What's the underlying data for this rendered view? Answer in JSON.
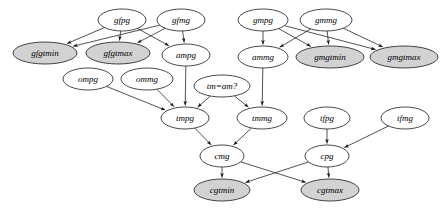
{
  "diagram": {
    "type": "directed-acyclic-graph",
    "colors": {
      "node_fill": "#ffffff",
      "node_fill_shaded": "#d2d2d2",
      "node_stroke": "#1a1a1a",
      "edge_stroke": "#1a1a1a",
      "label_color": "#000000",
      "background": "#ffffff"
    },
    "nodes": [
      {
        "id": "gfpg",
        "label": "gfpg",
        "cx": 122,
        "cy": 20,
        "rx": 24,
        "ry": 11,
        "shaded": false
      },
      {
        "id": "gfmg",
        "label": "gfmg",
        "cx": 181,
        "cy": 20,
        "rx": 24,
        "ry": 11,
        "shaded": false
      },
      {
        "id": "gfgtmin",
        "label": "gfgtmin",
        "cx": 45,
        "cy": 53,
        "rx": 32,
        "ry": 11,
        "shaded": true
      },
      {
        "id": "gfgtmax",
        "label": "gfgtmax",
        "cx": 118,
        "cy": 53,
        "rx": 32,
        "ry": 11,
        "shaded": true
      },
      {
        "id": "ampg",
        "label": "ampg",
        "cx": 186,
        "cy": 55,
        "rx": 24,
        "ry": 11,
        "shaded": false
      },
      {
        "id": "gmpg",
        "label": "gmpg",
        "cx": 263,
        "cy": 20,
        "rx": 25,
        "ry": 11,
        "shaded": false
      },
      {
        "id": "gmmg",
        "label": "gmmg",
        "cx": 326,
        "cy": 20,
        "rx": 26,
        "ry": 11,
        "shaded": false
      },
      {
        "id": "ammg",
        "label": "ammg",
        "cx": 263,
        "cy": 57,
        "rx": 25,
        "ry": 11,
        "shaded": false
      },
      {
        "id": "gmgtmin",
        "label": "gmgtmin",
        "cx": 330,
        "cy": 57,
        "rx": 34,
        "ry": 11,
        "shaded": true
      },
      {
        "id": "gmgtmax",
        "label": "gmgtmax",
        "cx": 404,
        "cy": 57,
        "rx": 34,
        "ry": 11,
        "shaded": true
      },
      {
        "id": "ompg",
        "label": "ompg",
        "cx": 88,
        "cy": 79,
        "rx": 25,
        "ry": 11,
        "shaded": false
      },
      {
        "id": "ommg",
        "label": "ommg",
        "cx": 147,
        "cy": 79,
        "rx": 26,
        "ry": 11,
        "shaded": false
      },
      {
        "id": "tmeqam",
        "label": "tm=am?",
        "cx": 222,
        "cy": 86,
        "rx": 28,
        "ry": 11,
        "shaded": false
      },
      {
        "id": "tmpg",
        "label": "tmpg",
        "cx": 185,
        "cy": 118,
        "rx": 24,
        "ry": 11,
        "shaded": false
      },
      {
        "id": "tmmg",
        "label": "tmmg",
        "cx": 262,
        "cy": 118,
        "rx": 25,
        "ry": 11,
        "shaded": false
      },
      {
        "id": "tfpg",
        "label": "tfpg",
        "cx": 327,
        "cy": 118,
        "rx": 23,
        "ry": 11,
        "shaded": false
      },
      {
        "id": "tfmg",
        "label": "tfmg",
        "cx": 405,
        "cy": 118,
        "rx": 24,
        "ry": 11,
        "shaded": false
      },
      {
        "id": "cmg",
        "label": "cmg",
        "cx": 222,
        "cy": 156,
        "rx": 22,
        "ry": 11,
        "shaded": false
      },
      {
        "id": "cpg",
        "label": "cpg",
        "cx": 327,
        "cy": 156,
        "rx": 22,
        "ry": 11,
        "shaded": false
      },
      {
        "id": "cgtmin",
        "label": "cgtmin",
        "cx": 222,
        "cy": 190,
        "rx": 28,
        "ry": 11,
        "shaded": true
      },
      {
        "id": "cgtmax",
        "label": "cgtmax",
        "cx": 330,
        "cy": 190,
        "rx": 29,
        "ry": 11,
        "shaded": true
      }
    ],
    "edges": [
      {
        "from": "gfpg",
        "to": "gfgtmin"
      },
      {
        "from": "gfpg",
        "to": "gfgtmax"
      },
      {
        "from": "gfpg",
        "to": "ampg"
      },
      {
        "from": "gfmg",
        "to": "gfgtmin"
      },
      {
        "from": "gfmg",
        "to": "gfgtmax"
      },
      {
        "from": "gfmg",
        "to": "ampg"
      },
      {
        "from": "gmpg",
        "to": "ammg"
      },
      {
        "from": "gmpg",
        "to": "gmgtmin"
      },
      {
        "from": "gmpg",
        "to": "gmgtmax"
      },
      {
        "from": "gmmg",
        "to": "ammg"
      },
      {
        "from": "gmmg",
        "to": "gmgtmin"
      },
      {
        "from": "gmmg",
        "to": "gmgtmax"
      },
      {
        "from": "ampg",
        "to": "tmpg"
      },
      {
        "from": "ammg",
        "to": "tmmg"
      },
      {
        "from": "ompg",
        "to": "tmpg"
      },
      {
        "from": "ommg",
        "to": "tmpg"
      },
      {
        "from": "tmeqam",
        "to": "tmpg"
      },
      {
        "from": "tmeqam",
        "to": "tmmg"
      },
      {
        "from": "tmpg",
        "to": "cmg"
      },
      {
        "from": "tmmg",
        "to": "cmg"
      },
      {
        "from": "tfpg",
        "to": "cpg"
      },
      {
        "from": "tfmg",
        "to": "cpg"
      },
      {
        "from": "cmg",
        "to": "cgtmin"
      },
      {
        "from": "cmg",
        "to": "cgtmax"
      },
      {
        "from": "cpg",
        "to": "cgtmin"
      },
      {
        "from": "cpg",
        "to": "cgtmax"
      }
    ]
  }
}
